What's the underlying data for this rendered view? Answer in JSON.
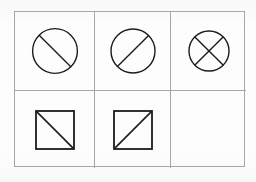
{
  "puzzle": {
    "title": "Matrix reasoning puzzle",
    "description": "Three-by-two matrix of geometric figures with one empty cell",
    "grid": {
      "columns": 3,
      "rows": 2
    },
    "colors": {
      "background": "#fdfdfd",
      "grid_line": "#a6a6a8",
      "figure_stroke": "#1c1c1c"
    },
    "cells": [
      {
        "id": "cell-r1c1",
        "position": "row 1, column 1",
        "shape": "circle",
        "shape_icon": "circle-backslash-icon",
        "marks": [
          "backslash-diagonal"
        ],
        "empty": false,
        "size": 45,
        "stroke_width": 1.4
      },
      {
        "id": "cell-r1c2",
        "position": "row 1, column 2",
        "shape": "circle",
        "shape_icon": "circle-slash-icon",
        "marks": [
          "forward-slash-diagonal"
        ],
        "empty": false,
        "size": 44,
        "stroke_width": 1.4
      },
      {
        "id": "cell-r1c3",
        "position": "row 1, column 3",
        "shape": "circle",
        "shape_icon": "circle-cross-icon",
        "marks": [
          "backslash-diagonal",
          "forward-slash-diagonal"
        ],
        "empty": false,
        "size": 40,
        "stroke_width": 1.4
      },
      {
        "id": "cell-r2c1",
        "position": "row 2, column 1",
        "shape": "square",
        "shape_icon": "square-backslash-icon",
        "marks": [
          "backslash-diagonal"
        ],
        "empty": false,
        "size": 38,
        "stroke_width": 1.8
      },
      {
        "id": "cell-r2c2",
        "position": "row 2, column 2",
        "shape": "square",
        "shape_icon": "square-slash-icon",
        "marks": [
          "forward-slash-diagonal"
        ],
        "empty": false,
        "size": 38,
        "stroke_width": 1.8
      },
      {
        "id": "cell-r2c3",
        "position": "row 2, column 3",
        "shape": "none",
        "shape_icon": "empty-cell-icon",
        "marks": [],
        "empty": true,
        "size": 0,
        "stroke_width": 0
      }
    ]
  }
}
